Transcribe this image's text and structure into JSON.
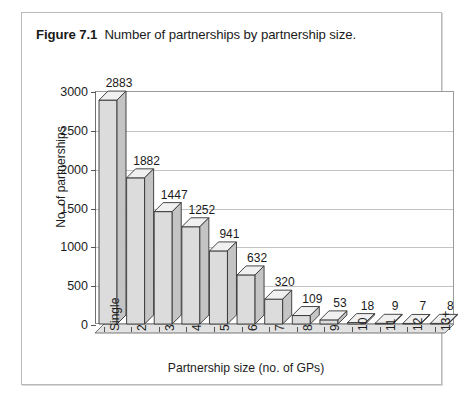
{
  "caption": {
    "label": "Figure 7.1",
    "text": "Number of partnerships by partnership size."
  },
  "chart_data": {
    "type": "bar",
    "title": "Number of partnerships by partnership size.",
    "xlabel": "Partnership size (no. of GPs)",
    "ylabel": "No. of partnerships",
    "categories": [
      "Single",
      "2",
      "3",
      "4",
      "5",
      "6",
      "7",
      "8",
      "9",
      "10",
      "11",
      "12",
      "13+"
    ],
    "values": [
      2883,
      1882,
      1447,
      1252,
      941,
      632,
      320,
      109,
      53,
      18,
      9,
      7,
      8
    ],
    "value_labels": [
      "2883",
      "1882",
      "1447",
      "1252",
      "941",
      "632",
      "320",
      "109",
      "53",
      "18",
      "9",
      "7",
      "8"
    ],
    "ylim": [
      0,
      3000
    ],
    "yticks": [
      0,
      500,
      1000,
      1500,
      2000,
      2500,
      3000
    ],
    "ytick_labels": [
      "0",
      "500",
      "1000",
      "1500",
      "2000",
      "2500",
      "3000"
    ],
    "grid": true,
    "legend": "none",
    "style": "3d-column",
    "colors": {
      "bar_front": "#dcdcdc",
      "bar_top": "#f0f0f0",
      "bar_side": "#c4c4c4",
      "bar_outline": "#333333",
      "gridline": "#c3c3c3",
      "axis": "#555555",
      "floor_top": "#e2e2e2",
      "floor_front": "#cfcfcf",
      "text": "#1a1a1a",
      "frame": "#b9b9b9"
    }
  }
}
